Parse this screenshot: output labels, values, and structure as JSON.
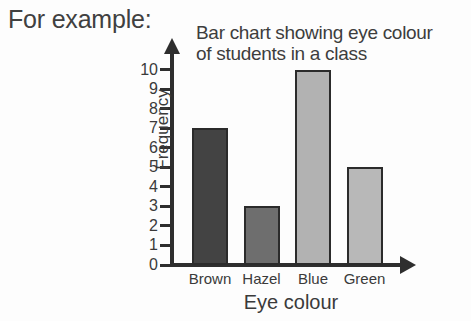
{
  "intro": {
    "text": "For example:"
  },
  "chart_data": {
    "type": "bar",
    "title": "Bar chart showing eye colour of students in a class",
    "title_lines": [
      "Bar chart showing eye colour",
      "of students in a class"
    ],
    "categories": [
      "Brown",
      "Hazel",
      "Blue",
      "Green"
    ],
    "values": [
      7,
      3,
      10,
      5
    ],
    "xlabel": "Eye colour",
    "ylabel": "Frequency",
    "ylim": [
      0,
      10
    ],
    "ytick_labels": [
      "10",
      "9",
      "8",
      "7",
      "6",
      "5",
      "4",
      "3",
      "2",
      "1",
      "0"
    ],
    "ytick_values": [
      10,
      9,
      8,
      7,
      6,
      5,
      4,
      3,
      2,
      1,
      0
    ],
    "grid": false,
    "legend": false,
    "bar_colors": [
      "#434343",
      "#6e6e6e",
      "#b2b2b2",
      "#b8b8b8"
    ],
    "bar_border_color": "#2b2b2b",
    "axis_color": "#2e2e2e",
    "background_color": "#fdfdfd",
    "text_color": "#3a3a3a"
  }
}
